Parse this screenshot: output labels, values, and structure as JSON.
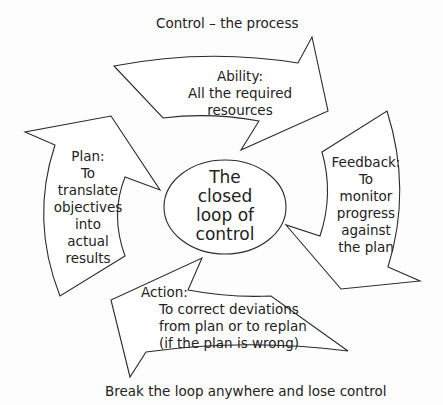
{
  "title": "Control – the process",
  "footer": "Break the loop anywhere and lose control",
  "center": {
    "lines": [
      "The",
      "closed",
      "loop of",
      "control"
    ]
  },
  "arrows": {
    "ability": {
      "lines": [
        "Ability:",
        "All the required",
        "resources"
      ]
    },
    "feedback": {
      "lines": [
        "Feedback:",
        "To",
        "monitor",
        "progress",
        "against",
        "the plan"
      ]
    },
    "action": {
      "lines": [
        "Action:",
        "To correct deviations",
        "from plan or to replan",
        "(if the plan is wrong)"
      ]
    },
    "plan": {
      "lines": [
        "Plan:",
        "To",
        "translate",
        "objectives",
        "into",
        "actual",
        "results"
      ]
    }
  },
  "colors": {
    "stroke": "#2a2a2a",
    "text": "#222222",
    "fill": "#ffffff"
  }
}
